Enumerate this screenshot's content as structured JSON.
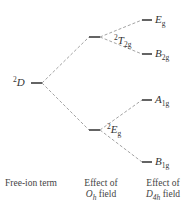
{
  "diagram": {
    "type": "energy-level-splitting",
    "levels": {
      "free_ion": {
        "sup": "2",
        "main": "D",
        "sub": ""
      },
      "oh_upper": {
        "sup": "2",
        "main": "T",
        "sub": "2g"
      },
      "oh_lower": {
        "sup": "2",
        "main": "E",
        "sub": "g"
      },
      "d4h_1": {
        "main": "E",
        "sub": "g"
      },
      "d4h_2": {
        "main": "B",
        "sub": "2g"
      },
      "d4h_3": {
        "main": "A",
        "sub": "1g"
      },
      "d4h_4": {
        "main": "B",
        "sub": "1g"
      }
    },
    "captions": {
      "free_ion": "Free-ion term",
      "oh_line1": "Effect of",
      "oh_sym": "O",
      "oh_sym_sub": "h",
      "oh_field": " field",
      "d4h_line1": "Effect of",
      "d4h_sym": "D",
      "d4h_sym_sub": "4h",
      "d4h_field": " field"
    },
    "colors": {
      "level": "#222222",
      "connector": "#999999",
      "text": "#333333"
    }
  }
}
